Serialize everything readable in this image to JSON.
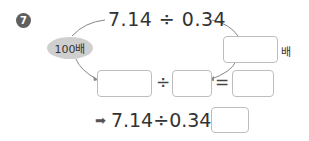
{
  "problem": {
    "number": "7",
    "top_expression": "7.14 ÷ 0.34",
    "left_multiplier_label": "100배",
    "right_multiplier_unit": "배",
    "right_multiplier_value": "",
    "middle_row": {
      "dividend_value": "",
      "operator_divide": "÷",
      "divisor_value": "",
      "operator_equals": "=",
      "result_value": ""
    },
    "bottom": {
      "arrow_icon": "arrow-right-icon",
      "expression": "7.14÷0.34=",
      "answer_value": ""
    }
  }
}
